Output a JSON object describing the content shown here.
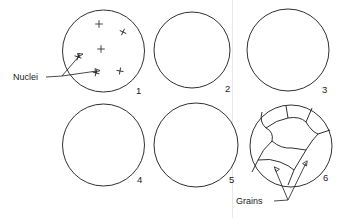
{
  "figure": {
    "title_text": "",
    "background_color": "#ffffff",
    "ink_color": "#1a1a1a",
    "width": 340,
    "height": 218
  },
  "annotations": {
    "nuclei_label": "Nuclei",
    "grains_label": "Grains"
  },
  "panels": [
    {
      "number": "1",
      "stage": "nucleation",
      "cx": 103.5,
      "cy": 51,
      "r": 41,
      "num_x": 136,
      "num_y": 94,
      "nuclei": [
        {
          "x": 99,
          "y": 24,
          "s": 3.4,
          "rot": 0
        },
        {
          "x": 123,
          "y": 32,
          "s": 3.2,
          "rot": 25
        },
        {
          "x": 101,
          "y": 49,
          "s": 3.4,
          "rot": 0
        },
        {
          "x": 78,
          "y": 57,
          "s": 3.2,
          "rot": 20
        },
        {
          "x": 96,
          "y": 73,
          "s": 3.0,
          "rot": 15
        },
        {
          "x": 120,
          "y": 71,
          "s": 3.2,
          "rot": 10
        }
      ],
      "crystallites": []
    },
    {
      "number": "2",
      "stage": "early-growth",
      "cx": 192,
      "cy": 50,
      "r": 38,
      "num_x": 225,
      "num_y": 92,
      "nuclei": [],
      "crystallites": [
        {
          "x": 180,
          "y": 29,
          "s": 5.2,
          "rot": -10,
          "dark": true
        },
        {
          "x": 214,
          "y": 38,
          "s": 4.6,
          "rot": 20,
          "dark": true
        },
        {
          "x": 192,
          "y": 50,
          "s": 5.0,
          "rot": 5,
          "dark": true
        },
        {
          "x": 166,
          "y": 54,
          "s": 4.6,
          "rot": -25,
          "dark": true
        },
        {
          "x": 185,
          "y": 72,
          "s": 4.8,
          "rot": 15,
          "dark": true
        },
        {
          "x": 213,
          "y": 70,
          "s": 4.6,
          "rot": -15,
          "dark": true
        }
      ]
    },
    {
      "number": "3",
      "stage": "growth-and-impingement",
      "cx": 288,
      "cy": 50,
      "r": 41,
      "num_x": 322,
      "num_y": 93,
      "nuclei": [],
      "crystallites": [
        {
          "x": 274,
          "y": 26,
          "s": 5.2,
          "rot": 10,
          "dark": true
        },
        {
          "x": 300,
          "y": 27,
          "s": 4.8,
          "rot": -20,
          "dark": false
        },
        {
          "x": 258,
          "y": 40,
          "s": 4.8,
          "rot": 30,
          "dark": false
        },
        {
          "x": 284,
          "y": 44,
          "s": 5.4,
          "rot": -5,
          "dark": true
        },
        {
          "x": 312,
          "y": 42,
          "s": 5.0,
          "rot": 15,
          "dark": true
        },
        {
          "x": 265,
          "y": 58,
          "s": 5.0,
          "rot": -30,
          "dark": true
        },
        {
          "x": 296,
          "y": 62,
          "s": 4.8,
          "rot": 25,
          "dark": false
        },
        {
          "x": 316,
          "y": 64,
          "s": 4.6,
          "rot": -10,
          "dark": true
        },
        {
          "x": 276,
          "y": 74,
          "s": 4.8,
          "rot": 35,
          "dark": true
        },
        {
          "x": 302,
          "y": 76,
          "s": 4.4,
          "rot": -25,
          "dark": false
        }
      ]
    },
    {
      "number": "4",
      "stage": "late-growth",
      "cx": 103.5,
      "cy": 145,
      "r": 41,
      "num_x": 137,
      "num_y": 183,
      "nuclei": [],
      "crystallites": [
        {
          "x": 90,
          "y": 119,
          "s": 5.2,
          "rot": -12,
          "dark": true
        },
        {
          "x": 114,
          "y": 117,
          "s": 4.6,
          "rot": 22,
          "dark": false
        },
        {
          "x": 74,
          "y": 131,
          "s": 4.8,
          "rot": 34,
          "dark": false
        },
        {
          "x": 100,
          "y": 133,
          "s": 5.0,
          "rot": -28,
          "dark": false
        },
        {
          "x": 124,
          "y": 131,
          "s": 4.8,
          "rot": 8,
          "dark": true
        },
        {
          "x": 68,
          "y": 147,
          "s": 5.2,
          "rot": 16,
          "dark": true
        },
        {
          "x": 92,
          "y": 147,
          "s": 4.6,
          "rot": -20,
          "dark": false
        },
        {
          "x": 116,
          "y": 149,
          "s": 5.0,
          "rot": 30,
          "dark": true
        },
        {
          "x": 134,
          "y": 147,
          "s": 4.4,
          "rot": -8,
          "dark": false
        },
        {
          "x": 78,
          "y": 163,
          "s": 4.8,
          "rot": -32,
          "dark": false
        },
        {
          "x": 102,
          "y": 165,
          "s": 4.6,
          "rot": 12,
          "dark": false
        },
        {
          "x": 124,
          "y": 167,
          "s": 4.4,
          "rot": 26,
          "dark": true
        },
        {
          "x": 60,
          "y": 157,
          "s": 4.2,
          "rot": 0,
          "dark": false
        }
      ]
    },
    {
      "number": "5",
      "stage": "impingement-complete",
      "cx": 196,
      "cy": 145,
      "r": 42,
      "num_x": 229,
      "num_y": 183,
      "nuclei": [],
      "crystallites": [
        {
          "x": 183,
          "y": 115,
          "s": 4.8,
          "rot": -14,
          "dark": false
        },
        {
          "x": 206,
          "y": 114,
          "s": 4.4,
          "rot": 24,
          "dark": true
        },
        {
          "x": 166,
          "y": 126,
          "s": 4.6,
          "rot": 32,
          "dark": false
        },
        {
          "x": 190,
          "y": 127,
          "s": 5.0,
          "rot": -26,
          "dark": true
        },
        {
          "x": 214,
          "y": 126,
          "s": 4.6,
          "rot": 10,
          "dark": false
        },
        {
          "x": 160,
          "y": 141,
          "s": 5.0,
          "rot": 18,
          "dark": true
        },
        {
          "x": 184,
          "y": 142,
          "s": 4.6,
          "rot": -18,
          "dark": false
        },
        {
          "x": 208,
          "y": 141,
          "s": 4.8,
          "rot": 28,
          "dark": true
        },
        {
          "x": 229,
          "y": 140,
          "s": 4.4,
          "rot": -6,
          "dark": false
        },
        {
          "x": 168,
          "y": 157,
          "s": 4.8,
          "rot": -34,
          "dark": true
        },
        {
          "x": 192,
          "y": 158,
          "s": 4.6,
          "rot": 14,
          "dark": false
        },
        {
          "x": 216,
          "y": 157,
          "s": 4.6,
          "rot": 24,
          "dark": true
        },
        {
          "x": 180,
          "y": 172,
          "s": 4.2,
          "rot": -10,
          "dark": false
        },
        {
          "x": 204,
          "y": 171,
          "s": 4.4,
          "rot": 20,
          "dark": false
        },
        {
          "x": 232,
          "y": 156,
          "s": 4.0,
          "rot": 0,
          "dark": false
        },
        {
          "x": 158,
          "y": 166,
          "s": 4.0,
          "rot": 8,
          "dark": false
        }
      ]
    },
    {
      "number": "6",
      "stage": "grain-structure",
      "cx": 291,
      "cy": 146,
      "r": 41,
      "num_x": 323,
      "num_y": 181,
      "nuclei": [],
      "crystallites": []
    }
  ],
  "sequence_caption": "",
  "legend": {
    "nuclei_arrow_count": 2,
    "grains_arrow_count": 2
  }
}
